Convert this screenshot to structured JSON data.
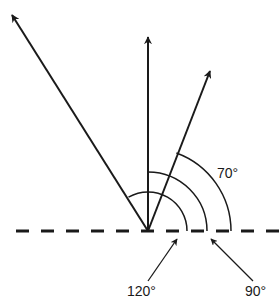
{
  "diagram": {
    "type": "angle-vectors",
    "origin": {
      "x": 148,
      "y": 231
    },
    "baseline": {
      "style": "dashed",
      "y": 231,
      "x_start": 16,
      "x_end": 279,
      "dash": 13,
      "gap": 12,
      "color": "#1a1a1a"
    },
    "vectors": [
      {
        "id": "vector-120",
        "angle_deg": 120,
        "tip": {
          "x": 11,
          "y": 14
        }
      },
      {
        "id": "vector-90",
        "angle_deg": 90,
        "tip": {
          "x": 148,
          "y": 36
        }
      },
      {
        "id": "vector-70",
        "angle_deg": 70,
        "tip": {
          "x": 211,
          "y": 70
        }
      }
    ],
    "arcs": [
      {
        "id": "arc-120",
        "radius": 39,
        "angle_deg": 120
      },
      {
        "id": "arc-90",
        "radius": 59,
        "angle_deg": 90
      },
      {
        "id": "arc-70",
        "radius": 83,
        "angle_deg": 70
      }
    ],
    "labels": {
      "angle_70": "70°",
      "angle_120": "120°",
      "angle_90": "90°"
    },
    "pointers": [
      {
        "id": "pointer-120",
        "from": {
          "x": 148,
          "y": 281
        },
        "to": {
          "x": 177,
          "y": 238
        },
        "label_key": "angle_120"
      },
      {
        "id": "pointer-90",
        "from": {
          "x": 253,
          "y": 281
        },
        "to": {
          "x": 210,
          "y": 238
        },
        "label_key": "angle_90"
      }
    ],
    "stroke_color": "#1a1a1a"
  }
}
